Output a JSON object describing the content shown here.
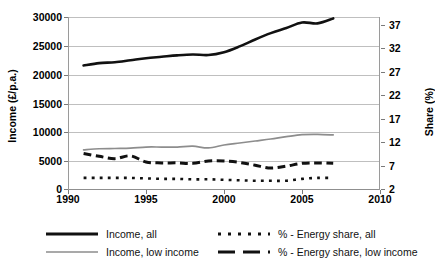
{
  "chart_data": {
    "type": "line",
    "title": "",
    "xlabel": "",
    "ylabel": "Income (£/p.a.)",
    "ylabel_secondary": "Share (%)",
    "x": [
      1991,
      1992,
      1993,
      1994,
      1995,
      1996,
      1997,
      1998,
      1999,
      2000,
      2001,
      2002,
      2003,
      2004,
      2005,
      2006,
      2007
    ],
    "xlim": [
      1990,
      2010
    ],
    "xticks": [
      "1990",
      "1995",
      "2000",
      "2005",
      "2010"
    ],
    "ylim": [
      0,
      30000
    ],
    "yticks": [
      "0",
      "5000",
      "10000",
      "15000",
      "20000",
      "25000",
      "30000"
    ],
    "ylim_secondary": [
      2,
      37
    ],
    "yticks_secondary": [
      "2",
      "7",
      "12",
      "17",
      "22",
      "27",
      "32",
      "37"
    ],
    "grid": true,
    "legend_position": "bottom",
    "series": [
      {
        "name": "Income, all",
        "axis": "left",
        "style": "solid",
        "color": "#111111",
        "width": 2.6,
        "values": [
          21600,
          22000,
          22150,
          22500,
          22850,
          23100,
          23350,
          23500,
          23400,
          23900,
          24900,
          26100,
          27200,
          28100,
          29050,
          28900,
          29750
        ]
      },
      {
        "name": "Income, low income",
        "axis": "left",
        "style": "solid",
        "color": "#8d8d8d",
        "width": 1.7,
        "values": [
          6950,
          7150,
          7200,
          7250,
          7450,
          7450,
          7450,
          7600,
          7300,
          7800,
          8150,
          8500,
          8850,
          9250,
          9600,
          9650,
          9550
        ]
      },
      {
        "name": "% - Energy share, all",
        "axis": "right",
        "style": "dotted",
        "color": "#111111",
        "width": 2.6,
        "values": [
          4.4,
          4.4,
          4.4,
          4.4,
          4.3,
          4.2,
          4.2,
          4.1,
          4.1,
          4.0,
          3.9,
          3.8,
          3.8,
          3.8,
          4.2,
          4.4,
          4.4
        ]
      },
      {
        "name": "% - Energy share, low income",
        "axis": "right",
        "style": "dashed",
        "color": "#111111",
        "width": 3.0,
        "values": [
          9.6,
          9.0,
          8.5,
          9.1,
          7.8,
          7.6,
          7.6,
          7.5,
          8.0,
          8.0,
          7.7,
          7.1,
          6.5,
          6.9,
          7.5,
          7.6,
          7.5
        ]
      }
    ]
  },
  "axes": {
    "left_title": "Income (£/p.a.)",
    "right_title": "Share (%)",
    "left_ticks": [
      "30000",
      "25000",
      "20000",
      "15000",
      "10000",
      "5000",
      "0"
    ],
    "right_ticks": [
      "37",
      "32",
      "27",
      "22",
      "17",
      "12",
      "7",
      "2"
    ],
    "x_ticks": [
      "1990",
      "1995",
      "2000",
      "2005",
      "2010"
    ]
  },
  "legend": {
    "items": [
      {
        "label": "Income, all",
        "icon": "solid-thick-black-line-icon"
      },
      {
        "label": "Income, low income",
        "icon": "solid-thin-gray-line-icon"
      },
      {
        "label": "% - Energy share, all",
        "icon": "dotted-black-line-icon"
      },
      {
        "label": "% - Energy share, low income",
        "icon": "dashed-black-line-icon"
      }
    ]
  }
}
